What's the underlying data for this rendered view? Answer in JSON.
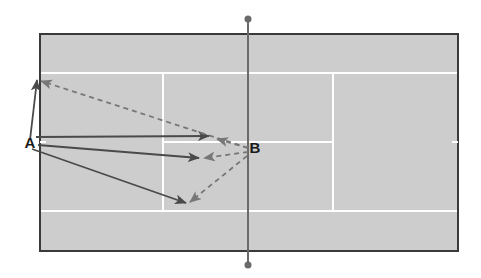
{
  "diagram": {
    "type": "tennis-court-shot-directions",
    "colors": {
      "background": "#ffffff",
      "court_surface": "#cdcdcd",
      "court_border": "#3a3a3a",
      "court_lines": "#ffffff",
      "net": "#6a6a6a",
      "shot_solid": "#4a4a4a",
      "shot_dashed": "#777777"
    },
    "court": {
      "outer": {
        "x": 40,
        "y": 34,
        "width": 418,
        "height": 217
      },
      "singles_top_y": 73,
      "singles_bottom_y": 211,
      "service_line_left_x": 163,
      "service_line_right_x": 333,
      "center_service_y": 142,
      "center_mark_right": {
        "x1": 452,
        "x2": 458,
        "y": 142
      },
      "center_mark_left": {
        "x1": 40,
        "x2": 46,
        "y": 142
      }
    },
    "net": {
      "x": 248,
      "top_y": 19,
      "bottom_y": 265,
      "post_radius": 3.5
    },
    "players": [
      {
        "id": "A",
        "label": "A",
        "x": 30,
        "y": 148
      },
      {
        "id": "B",
        "label": "B",
        "x": 255,
        "y": 153
      }
    ],
    "shots": {
      "from_A_solid": [
        {
          "name": "A-to-top-corner",
          "x1": 30,
          "y1": 140,
          "x2": 37,
          "y2": 80
        },
        {
          "name": "A-to-center-service-T",
          "x1": 36,
          "y1": 137,
          "x2": 209,
          "y2": 136
        },
        {
          "name": "A-to-mid-service-box",
          "x1": 38,
          "y1": 145,
          "x2": 199,
          "y2": 158
        },
        {
          "name": "A-to-bottom-service-corner",
          "x1": 32,
          "y1": 149,
          "x2": 186,
          "y2": 203
        }
      ],
      "from_B_dashed": [
        {
          "name": "B-to-top-corner",
          "x1": 248,
          "y1": 148,
          "x2": 41,
          "y2": 81
        },
        {
          "name": "B-to-center-service-T",
          "x1": 248,
          "y1": 148,
          "x2": 217,
          "y2": 139
        },
        {
          "name": "B-to-mid-service-box",
          "x1": 248,
          "y1": 152,
          "x2": 204,
          "y2": 158
        },
        {
          "name": "B-to-bottom-service-corner",
          "x1": 247,
          "y1": 156,
          "x2": 190,
          "y2": 202
        }
      ]
    }
  }
}
